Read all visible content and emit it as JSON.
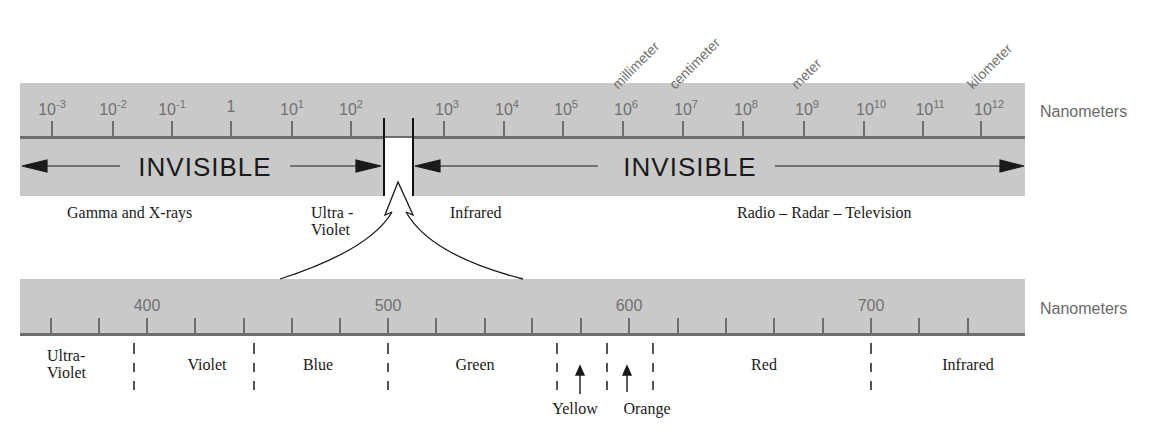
{
  "upper_scale": {
    "unit_label": "Nanometers",
    "ticks": [
      {
        "base": "10",
        "exp": "-3",
        "x": 52
      },
      {
        "base": "10",
        "exp": "-2",
        "x": 113
      },
      {
        "base": "10",
        "exp": "-1",
        "x": 172
      },
      {
        "base": "1",
        "exp": "",
        "x": 231
      },
      {
        "base": "10",
        "exp": "1",
        "x": 292
      },
      {
        "base": "10",
        "exp": "2",
        "x": 351
      },
      {
        "base": "10",
        "exp": "3",
        "x": 444
      },
      {
        "base": "10",
        "exp": "4",
        "x": 504
      },
      {
        "base": "10",
        "exp": "5",
        "x": 563
      },
      {
        "base": "10",
        "exp": "6",
        "x": 623
      },
      {
        "base": "10",
        "exp": "7",
        "x": 683
      },
      {
        "base": "10",
        "exp": "8",
        "x": 743
      },
      {
        "base": "10",
        "exp": "9",
        "x": 804
      },
      {
        "base": "10",
        "exp": "10",
        "x": 864
      },
      {
        "base": "10",
        "exp": "11",
        "x": 923
      },
      {
        "base": "10",
        "exp": "12",
        "x": 981
      }
    ],
    "length_markers": [
      {
        "label": "millimeter",
        "at": "10^6"
      },
      {
        "label": "centimeter",
        "at": "10^7"
      },
      {
        "label": "meter",
        "at": "10^9"
      },
      {
        "label": "kilometer",
        "at": "10^12"
      }
    ],
    "invisible_left": "INVISIBLE",
    "invisible_right": "INVISIBLE",
    "regions": {
      "gamma": "Gamma and X-rays",
      "uv_line1": "Ultra -",
      "uv_line2": "Violet",
      "infrared": "Infrared",
      "radio": "Radio – Radar – Television"
    }
  },
  "lower_scale": {
    "unit_label": "Nanometers",
    "labeled_ticks": [
      {
        "label": "400",
        "x": 147
      },
      {
        "label": "500",
        "x": 388
      },
      {
        "label": "600",
        "x": 629
      },
      {
        "label": "700",
        "x": 871
      }
    ],
    "tick_step_nm": 20,
    "regions": {
      "uv_line1": "Ultra-",
      "uv_line2": "Violet",
      "violet": "Violet",
      "blue": "Blue",
      "green": "Green",
      "yellow": "Yellow",
      "orange": "Orange",
      "red": "Red",
      "infrared": "Infrared"
    },
    "boundaries_nm": [
      390,
      455,
      500,
      570,
      590,
      610,
      700
    ]
  },
  "colors": {
    "band": "#c9c9c9",
    "axis": "#6e6e6e",
    "ink": "#1a1a1a"
  }
}
